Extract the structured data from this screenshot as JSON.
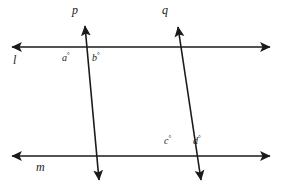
{
  "figure": {
    "background_color": "#ffffff",
    "stroke_color": "#1a1a1a",
    "width": 282,
    "height": 188
  },
  "lines": {
    "l": {
      "label": "l",
      "kind": "horizontal-line",
      "label_x": 13,
      "label_y": 54,
      "x1": 12,
      "y1": 47,
      "x2": 270,
      "y2": 47,
      "arrows": "both"
    },
    "m": {
      "label": "m",
      "kind": "horizontal-line",
      "label_x": 36,
      "label_y": 161,
      "x1": 12,
      "y1": 156,
      "x2": 270,
      "y2": 156,
      "arrows": "both"
    },
    "p": {
      "label": "p",
      "kind": "transversal-line",
      "label_x": 72,
      "label_y": 4,
      "x1": 85,
      "y1": 26,
      "x2": 99,
      "y2": 180,
      "arrows": "both"
    },
    "q": {
      "label": "q",
      "kind": "transversal-line",
      "label_x": 162,
      "label_y": 4,
      "x1": 178,
      "y1": 27,
      "x2": 201,
      "y2": 180,
      "arrows": "both"
    }
  },
  "angles": [
    {
      "id": "a",
      "label": "a",
      "degree_symbol": "°",
      "x": 62,
      "y": 52,
      "at": "intersection-p-l",
      "side": "left-below"
    },
    {
      "id": "b",
      "label": "b",
      "degree_symbol": "°",
      "x": 92,
      "y": 52,
      "at": "intersection-p-l",
      "side": "right-below"
    },
    {
      "id": "c",
      "label": "c",
      "degree_symbol": "°",
      "x": 164,
      "y": 135,
      "at": "intersection-q-m",
      "side": "left-above"
    },
    {
      "id": "d",
      "label": "d",
      "degree_symbol": "°",
      "x": 193,
      "y": 135,
      "at": "intersection-q-m",
      "side": "right-above"
    }
  ]
}
